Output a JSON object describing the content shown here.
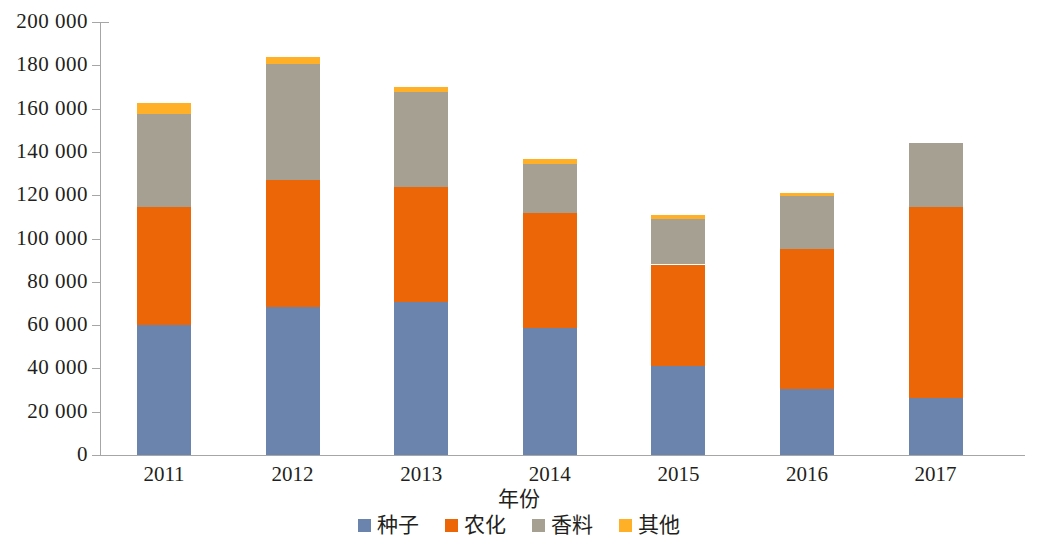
{
  "chart_data": {
    "type": "bar",
    "stacked": true,
    "title": "",
    "xlabel": "年份",
    "ylabel": "",
    "categories": [
      "2011",
      "2012",
      "2013",
      "2014",
      "2015",
      "2016",
      "2017"
    ],
    "series": [
      {
        "name": "种子",
        "color": "#6b84ad",
        "values": [
          60000,
          68500,
          70500,
          58500,
          41000,
          30500,
          26500
        ]
      },
      {
        "name": "农化",
        "color": "#ec6608",
        "values": [
          54500,
          58500,
          53500,
          53500,
          47000,
          64500,
          88000
        ]
      },
      {
        "name": "香料",
        "color": "#a6a093",
        "values": [
          43000,
          53500,
          43500,
          22500,
          21000,
          24500,
          29500
        ]
      },
      {
        "name": "其他",
        "color": "#ffb027",
        "values": [
          5000,
          3500,
          2500,
          2000,
          2000,
          1500,
          0
        ]
      }
    ],
    "totals": [
      162500,
      184000,
      170000,
      136500,
      111000,
      121000,
      144000
    ],
    "ylim": [
      0,
      200000
    ],
    "ytick_step": 20000,
    "ytick_labels": [
      "0",
      "20 000",
      "40 000",
      "60 000",
      "80 000",
      "100 000",
      "120 000",
      "140 000",
      "160 000",
      "180 000",
      "200 000"
    ],
    "grid": false,
    "legend_position": "bottom",
    "axis_color": "#a6a6a6",
    "text_color": "#231f20",
    "background": "#ffffff"
  },
  "legend": {
    "items": [
      {
        "label": "种子",
        "color": "#6b84ad"
      },
      {
        "label": "农化",
        "color": "#ec6608"
      },
      {
        "label": "香料",
        "color": "#a6a093"
      },
      {
        "label": "其他",
        "color": "#ffb027"
      }
    ]
  }
}
